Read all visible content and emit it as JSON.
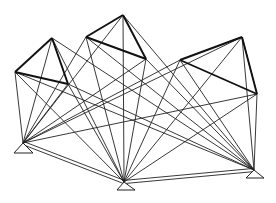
{
  "diagram": {
    "width": 276,
    "height": 203,
    "line_color": "#222222",
    "thick_color": "#111111",
    "pyramids": [
      {
        "name": "left",
        "apex": [
          52,
          38
        ],
        "left": [
          15,
          72
        ],
        "right": [
          68,
          84
        ]
      },
      {
        "name": "middle",
        "apex": [
          123,
          15
        ],
        "left": [
          86,
          37
        ],
        "right": [
          146,
          59
        ]
      },
      {
        "name": "right",
        "apex": [
          242,
          37
        ],
        "left": [
          180,
          60
        ],
        "right": [
          257,
          94
        ]
      }
    ],
    "ground_nodes": [
      {
        "name": "bottom-left",
        "apex": [
          23,
          143
        ],
        "base": [
          [
            14,
            153
          ],
          [
            33,
            153
          ]
        ]
      },
      {
        "name": "bottom-middle",
        "apex": [
          124,
          182
        ],
        "base": [
          [
            117,
            190
          ],
          [
            135,
            190
          ]
        ]
      },
      {
        "name": "bottom-right",
        "apex": [
          254,
          170
        ],
        "base": [
          [
            246,
            178
          ],
          [
            264,
            178
          ]
        ]
      }
    ],
    "double_edges": [
      {
        "from": "bottom-left",
        "to": "bottom-middle"
      },
      {
        "from": "bottom-middle",
        "to": "bottom-right"
      }
    ]
  }
}
